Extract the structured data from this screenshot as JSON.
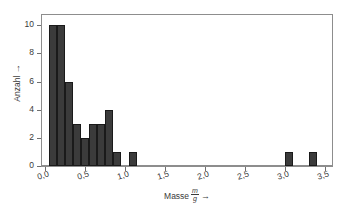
{
  "chart_data": {
    "type": "bar",
    "title": "",
    "subtitle": "",
    "xlabel": "Masse m/g →",
    "xlabel_text": "Masse",
    "xlabel_frac_numerator": "m",
    "xlabel_frac_denominator": "g",
    "xlabel_arrow": "→",
    "ylabel": "Anzahl →",
    "ylabel_text": "Anzahl",
    "ylabel_arrow": "→",
    "xlim": [
      -0.05,
      3.6
    ],
    "ylim": [
      0,
      10.8
    ],
    "grid": false,
    "legend": false,
    "bin_width": 0.1,
    "bar_color": "#3b3b3b",
    "bar_edge_color": "#1a1a1a",
    "frame_color": "#8d8d8d",
    "x_ticks": [
      0.0,
      0.5,
      1.0,
      1.5,
      2.0,
      2.5,
      3.0,
      3.5
    ],
    "x_tick_labels": [
      "0,0",
      "0,5",
      "1,0",
      "1,5",
      "2,0",
      "2,5",
      "3,0",
      "3,5"
    ],
    "y_ticks": [
      0,
      2,
      4,
      6,
      8,
      10
    ],
    "y_tick_labels": [
      "0",
      "2",
      "4",
      "6",
      "8",
      "10"
    ],
    "bins": [
      {
        "left": 0.05,
        "right": 0.15,
        "value": 10
      },
      {
        "left": 0.15,
        "right": 0.25,
        "value": 10
      },
      {
        "left": 0.25,
        "right": 0.35,
        "value": 6
      },
      {
        "left": 0.35,
        "right": 0.45,
        "value": 3
      },
      {
        "left": 0.45,
        "right": 0.55,
        "value": 2
      },
      {
        "left": 0.55,
        "right": 0.65,
        "value": 3
      },
      {
        "left": 0.65,
        "right": 0.75,
        "value": 3
      },
      {
        "left": 0.75,
        "right": 0.85,
        "value": 4
      },
      {
        "left": 0.85,
        "right": 0.95,
        "value": 1
      },
      {
        "left": 1.05,
        "right": 1.15,
        "value": 1
      },
      {
        "left": 3.0,
        "right": 3.1,
        "value": 1
      },
      {
        "left": 3.3,
        "right": 3.4,
        "value": 1
      }
    ],
    "categories": [
      "0.05-0.15",
      "0.15-0.25",
      "0.25-0.35",
      "0.35-0.45",
      "0.45-0.55",
      "0.55-0.65",
      "0.65-0.75",
      "0.75-0.85",
      "0.85-0.95",
      "1.05-1.15",
      "3.00-3.10",
      "3.30-3.40"
    ],
    "values": [
      10,
      10,
      6,
      3,
      2,
      3,
      3,
      4,
      1,
      1,
      1,
      1
    ]
  }
}
